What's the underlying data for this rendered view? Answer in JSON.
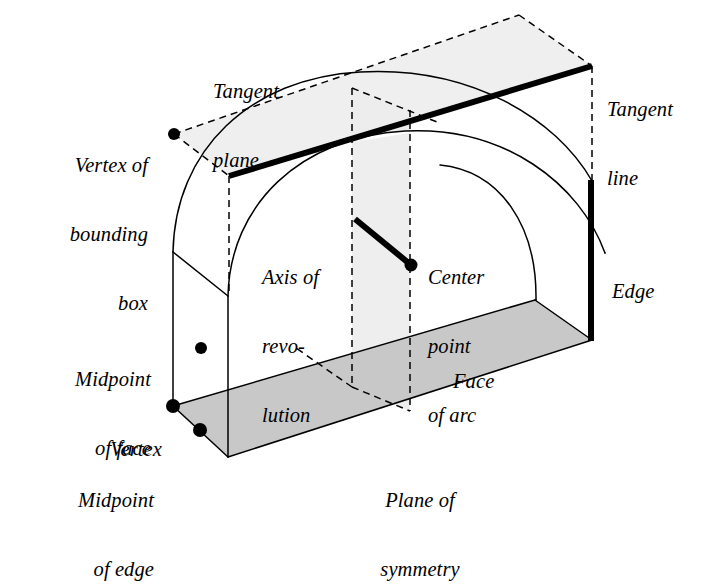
{
  "figure": {
    "background_color": "#ffffff",
    "line_color": "#000000",
    "bottom_face_fill": "#c8c8c8",
    "tangent_plane_fill": "#efefef",
    "symmetry_plane_fill": "#ededed",
    "thin_stroke_width": 1.3,
    "bold_stroke_width": 5.5,
    "dash_pattern": "7,5"
  },
  "labels": {
    "tangent_plane": {
      "line1": "Tangent",
      "line2": "plane"
    },
    "tangent_line": {
      "line1": "Tangent",
      "line2": "line"
    },
    "vertex_of_bounding_box": {
      "line1": "Vertex of",
      "line2": "bounding",
      "line3": "box"
    },
    "axis_of_revolution": {
      "line1": "Axis of",
      "line2": "revo-",
      "line3": "lution"
    },
    "center_point_of_arc": {
      "line1": "Center",
      "line2": "point",
      "line3": "of arc"
    },
    "edge": {
      "line1": "Edge"
    },
    "face": {
      "line1": "Face"
    },
    "midpoint_of_face": {
      "line1": "Midpoint",
      "line2": "of face"
    },
    "vertex": {
      "line1": "Vertex"
    },
    "midpoint_of_edge": {
      "line1": "Midpoint",
      "line2": "of edge"
    },
    "plane_of_symmetry": {
      "line1": "Plane of",
      "line2": "symmetry"
    }
  },
  "annotated_points": [
    {
      "name": "vertex-of-bounding-box-point",
      "x": 174,
      "y": 134,
      "r": 6.0
    },
    {
      "name": "center-point-of-arc-point",
      "x": 411,
      "y": 265,
      "r": 6.0
    },
    {
      "name": "midpoint-of-face-point",
      "x": 201,
      "y": 348,
      "r": 6.0
    },
    {
      "name": "vertex-point",
      "x": 173,
      "y": 406,
      "r": 6.5
    },
    {
      "name": "midpoint-of-edge-point",
      "x": 200,
      "y": 430,
      "r": 6.5
    }
  ],
  "geometry": {
    "bottom_face_quad": "173,406 228,457 592,340 535,300",
    "tangent_plane_quad": "174,134 229,176 592,66 519,15",
    "symmetry_plane_quad": "352,88 352,387 410,411 410,110",
    "tangent_line": {
      "x1": 229,
      "y1": 176,
      "x2": 592,
      "y2": 66
    },
    "axis_of_revolution_stub": {
      "x1": 355,
      "y1": 219,
      "x2": 411,
      "y2": 265
    },
    "bold_edge": {
      "x1": 591,
      "y1": 180,
      "x2": 591,
      "y2": 340
    },
    "left_vertical_edge": {
      "x1": 173,
      "y1": 252,
      "x2": 173,
      "y2": 406
    },
    "front_left_vertical_edge": {
      "x1": 228,
      "y1": 296,
      "x2": 228,
      "y2": 457
    },
    "left_slant_edge": {
      "x1": 173,
      "y1": 252,
      "x2": 228,
      "y2": 296
    },
    "back_arc_path": "M 173,252 C 175,150 250,78 360,72 C 470,66 556,118 592,181",
    "front_arc_path": "M 228,296 C 230,205 300,137 405,131 C 505,126 580,184 605,253",
    "inner_arc_path": "M 536,300 C 536,224 500,171 440,165",
    "vertical_dash_left": {
      "x1": 352,
      "y1": 88,
      "x2": 352,
      "y2": 387
    },
    "vertical_dash_right": {
      "x1": 410,
      "y1": 110,
      "x2": 410,
      "y2": 411
    },
    "right_vertical_dash": {
      "x1": 592,
      "y1": 66,
      "x2": 592,
      "y2": 181
    },
    "left_vertical_dash": {
      "x1": 229,
      "y1": 176,
      "x2": 229,
      "y2": 296
    },
    "tp_dash_a": {
      "x1": 174,
      "y1": 134,
      "x2": 229,
      "y2": 176
    },
    "tp_dash_b": {
      "x1": 174,
      "y1": 134,
      "x2": 519,
      "y2": 15
    },
    "tp_dash_c": {
      "x1": 519,
      "y1": 15,
      "x2": 592,
      "y2": 66
    },
    "tp_dash_d": {
      "x1": 352,
      "y1": 88,
      "x2": 437,
      "y2": 122
    },
    "sym_dash_bottom_left": {
      "x1": 352,
      "y1": 387,
      "x2": 410,
      "y2": 411
    },
    "sym_dash_bottom_diag": {
      "x1": 352,
      "y1": 387,
      "x2": 296,
      "y2": 348
    }
  },
  "label_positions": {
    "tangent_plane": {
      "left": 213,
      "top": 36
    },
    "tangent_line": {
      "left": 607,
      "top": 54
    },
    "vertex_of_bounding_box": {
      "left": 48,
      "top": 110
    },
    "axis_of_revolution": {
      "left": 262,
      "top": 222
    },
    "center_point_of_arc": {
      "left": 428,
      "top": 222
    },
    "edge": {
      "left": 612,
      "top": 235
    },
    "face": {
      "left": 453,
      "top": 325
    },
    "midpoint_of_face": {
      "left": 37,
      "top": 323
    },
    "vertex": {
      "left": 62,
      "top": 393
    },
    "midpoint_of_edge": {
      "left": 38,
      "top": 444
    },
    "plane_of_symmetry": {
      "left": 370,
      "top": 443
    }
  }
}
